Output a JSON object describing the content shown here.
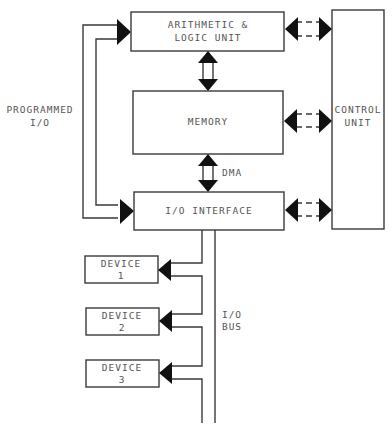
{
  "diagram": {
    "colors": {
      "line": "#3a3a3a",
      "arrowhead": "#111111",
      "text": "#555555",
      "background": "#ffffff"
    },
    "blocks": {
      "alu": {
        "line1": "ARITHMETIC &",
        "line2": "LOGIC UNIT"
      },
      "memory": {
        "label": "MEMORY"
      },
      "io_interface": {
        "label": "I/O INTERFACE"
      },
      "control_unit": {
        "line1": "CONTROL",
        "line2": "UNIT"
      },
      "devices": [
        {
          "line1": "DEVICE",
          "line2": "1"
        },
        {
          "line1": "DEVICE",
          "line2": "2"
        },
        {
          "line1": "DEVICE",
          "line2": "3"
        }
      ]
    },
    "labels": {
      "programmed_io_line1": "PROGRAMMED",
      "programmed_io_line2": "I/O",
      "dma": "DMA",
      "io_bus_line1": "I/O",
      "io_bus_line2": "BUS"
    },
    "connections": [
      {
        "from": "ALU",
        "to": "MEMORY",
        "style": "solid double arrow"
      },
      {
        "from": "MEMORY",
        "to": "I/O INTERFACE",
        "style": "solid double arrow",
        "label": "DMA"
      },
      {
        "from": "ALU",
        "to": "CONTROL UNIT",
        "style": "dashed double arrow"
      },
      {
        "from": "MEMORY",
        "to": "CONTROL UNIT",
        "style": "dashed double arrow"
      },
      {
        "from": "I/O INTERFACE",
        "to": "CONTROL UNIT",
        "style": "dashed double arrow"
      },
      {
        "from": "I/O INTERFACE",
        "to": "ALU",
        "style": "programmed I/O loop"
      },
      {
        "from": "I/O BUS",
        "to": "DEVICE 1"
      },
      {
        "from": "I/O BUS",
        "to": "DEVICE 2"
      },
      {
        "from": "I/O BUS",
        "to": "DEVICE 3"
      }
    ]
  }
}
